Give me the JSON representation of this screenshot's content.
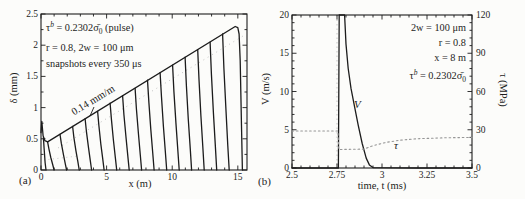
{
  "colors": {
    "ink": "#1c1c1c",
    "dotted_curve": "#969696",
    "artifact": "#c2c2c2",
    "paper": "#fcfcfa"
  },
  "chart_data": [
    {
      "id": "a",
      "type": "line",
      "panel_label": "(a)",
      "xlabel": "x (m)",
      "ylabel": "δ (mm)",
      "xlim": [
        0,
        15.7
      ],
      "ylim": [
        0,
        2.5
      ],
      "grid": false,
      "x_ticks": {
        "values": [
          0,
          5,
          10,
          15
        ],
        "labels": [
          "0",
          "5",
          "10",
          "15"
        ],
        "minor_step": 1
      },
      "y_ticks": {
        "values": [
          0,
          0.5,
          1,
          1.5,
          2,
          2.5
        ],
        "labels": [
          "0",
          "0.5",
          "1",
          "1.5",
          "2",
          "2.5"
        ],
        "minor_step": 0.25
      },
      "annotations": [
        {
          "base": "τ",
          "sup": "b",
          "mid": " = 0.2302",
          "sigma": "σ̄",
          "sub": "0",
          "tail": " (pulse)"
        },
        "r = 0.8, 2w = 100 μm",
        "snapshots every 350 μs"
      ],
      "slope_label": "0.14 mm/m",
      "slope_value_mm_per_m": 0.14,
      "snapshot_interval_us": 350,
      "series": [
        {
          "name": "slip-envelope",
          "style": "solid",
          "x": [
            0,
            0.06,
            0.16,
            0.3,
            0.5,
            14.8,
            15.0,
            15.1,
            15.18,
            15.28,
            15.35
          ],
          "y": [
            0.6,
            0.78,
            0.55,
            0.47,
            0.45,
            2.3,
            2.28,
            2.18,
            1.75,
            0.7,
            0
          ]
        },
        {
          "name": "nucleation-front",
          "style": "solid",
          "x": [
            0.18,
            0.24,
            0.31,
            0.38
          ],
          "y": [
            0.52,
            0.35,
            0.12,
            0
          ]
        },
        {
          "name": "snapshot-front-01",
          "style": "solid",
          "x": [
            0.5,
            0.6,
            0.75,
            0.9,
            1.0
          ],
          "y": [
            0.45,
            0.34,
            0.2,
            0.08,
            0
          ]
        },
        {
          "name": "snapshot-front-02",
          "style": "solid",
          "x": [
            1.45,
            1.55,
            1.7,
            1.85,
            1.95
          ],
          "y": [
            0.57,
            0.43,
            0.26,
            0.1,
            0
          ]
        },
        {
          "name": "snapshot-front-03",
          "style": "solid",
          "x": [
            2.41,
            2.51,
            2.66,
            2.81,
            2.91
          ],
          "y": [
            0.7,
            0.52,
            0.31,
            0.13,
            0
          ]
        },
        {
          "name": "snapshot-front-04",
          "style": "solid",
          "x": [
            3.36,
            3.46,
            3.61,
            3.76,
            3.86
          ],
          "y": [
            0.82,
            0.62,
            0.37,
            0.15,
            0
          ]
        },
        {
          "name": "snapshot-front-05",
          "style": "solid",
          "x": [
            4.31,
            4.41,
            4.56,
            4.71,
            4.81
          ],
          "y": [
            0.94,
            0.71,
            0.42,
            0.17,
            0
          ]
        },
        {
          "name": "snapshot-front-06",
          "style": "solid",
          "x": [
            5.27,
            5.37,
            5.52,
            5.67,
            5.77
          ],
          "y": [
            1.07,
            0.8,
            0.48,
            0.19,
            0
          ]
        },
        {
          "name": "snapshot-front-07",
          "style": "solid",
          "x": [
            6.22,
            6.32,
            6.47,
            6.62,
            6.72
          ],
          "y": [
            1.19,
            0.89,
            0.54,
            0.21,
            0
          ]
        },
        {
          "name": "snapshot-front-08",
          "style": "solid",
          "x": [
            7.17,
            7.27,
            7.42,
            7.57,
            7.67
          ],
          "y": [
            1.31,
            0.98,
            0.59,
            0.24,
            0
          ]
        },
        {
          "name": "snapshot-front-09",
          "style": "solid",
          "x": [
            8.12,
            8.22,
            8.37,
            8.52,
            8.62
          ],
          "y": [
            1.44,
            1.08,
            0.65,
            0.26,
            0
          ]
        },
        {
          "name": "snapshot-front-10",
          "style": "solid",
          "x": [
            9.08,
            9.18,
            9.33,
            9.48,
            9.58
          ],
          "y": [
            1.56,
            1.17,
            0.7,
            0.28,
            0
          ]
        },
        {
          "name": "snapshot-front-11",
          "style": "solid",
          "x": [
            10.03,
            10.13,
            10.28,
            10.43,
            10.53
          ],
          "y": [
            1.68,
            1.26,
            0.76,
            0.3,
            0
          ]
        },
        {
          "name": "snapshot-front-12",
          "style": "solid",
          "x": [
            10.98,
            11.08,
            11.23,
            11.38,
            11.48
          ],
          "y": [
            1.81,
            1.35,
            0.81,
            0.33,
            0
          ]
        },
        {
          "name": "snapshot-front-13",
          "style": "solid",
          "x": [
            11.94,
            12.04,
            12.19,
            12.34,
            12.44
          ],
          "y": [
            1.93,
            1.45,
            0.87,
            0.35,
            0
          ]
        },
        {
          "name": "snapshot-front-14",
          "style": "solid",
          "x": [
            12.89,
            12.99,
            13.14,
            13.29,
            13.39
          ],
          "y": [
            2.05,
            1.54,
            0.92,
            0.37,
            0
          ]
        },
        {
          "name": "snapshot-front-15",
          "style": "solid",
          "x": [
            13.84,
            13.94,
            14.09,
            14.24,
            14.34
          ],
          "y": [
            2.18,
            1.63,
            0.98,
            0.39,
            0
          ]
        }
      ]
    },
    {
      "id": "b",
      "type": "line",
      "panel_label": "(b)",
      "xlabel": "time, t (ms)",
      "ylabel": "V (m/s)",
      "ylabel2": "τ (MPa)",
      "xlim": [
        2.5,
        3.5
      ],
      "ylim": [
        0,
        20
      ],
      "y2lim": [
        0,
        120
      ],
      "grid": false,
      "x_ticks": {
        "values": [
          2.5,
          2.75,
          3,
          3.25,
          3.5
        ],
        "labels": [
          "2.5",
          "2.75",
          "3",
          "3.25",
          "3.5"
        ],
        "minor_step": 0.05
      },
      "y_ticks": {
        "values": [
          0,
          5,
          10,
          15,
          20
        ],
        "labels": [
          "0",
          "5",
          "10",
          "15",
          "20"
        ],
        "minor_step": 1
      },
      "y2_ticks": {
        "values": [
          0,
          30,
          60,
          90,
          120
        ],
        "labels": [
          "0",
          "30",
          "60",
          "90",
          "120"
        ],
        "minor_step": 6
      },
      "annotations": [
        "2w = 100 μm",
        "r = 0.8",
        "x = 8 m",
        {
          "base": "τ",
          "sup": "b",
          "mid": " = 0.2302",
          "sigma": "σ̄",
          "sub": "0"
        }
      ],
      "series": [
        {
          "name": "slip-velocity",
          "label": "V",
          "axis": "left",
          "style": "solid",
          "x": [
            2.5,
            2.758,
            2.762,
            2.766,
            2.792,
            2.8,
            2.812,
            2.828,
            2.848,
            2.868,
            2.89,
            2.912,
            2.93,
            2.95,
            3.2,
            3.5
          ],
          "y": [
            0,
            0,
            20,
            20,
            20,
            16.2,
            13,
            10.4,
            8,
            5.6,
            3.2,
            1.3,
            0.4,
            0.05,
            0,
            0
          ]
        },
        {
          "name": "shear-stress",
          "label": "τ",
          "axis": "right",
          "style": "dotted",
          "x": [
            2.5,
            2.755,
            2.76,
            2.9,
            2.95,
            3.02,
            3.1,
            3.2,
            3.35,
            3.5
          ],
          "y": [
            29,
            29,
            14.5,
            14.8,
            17.5,
            20,
            21.8,
            23,
            23.7,
            24
          ]
        }
      ]
    }
  ]
}
